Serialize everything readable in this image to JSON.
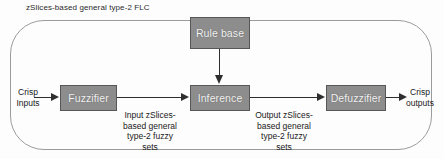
{
  "diagram": {
    "title": "zSlices-based general type-2 FLC",
    "blocks": {
      "rule_base": "Rule base",
      "fuzzifier": "Fuzzifier",
      "inference": "Inference",
      "defuzzifier": "Defuzzifier"
    },
    "labels": {
      "crisp_inputs": "Crisp\nInputs",
      "crisp_outputs": "Crisp\noutputs",
      "input_sets": "Input zSlices-\nbased general\ntype-2 fuzzy\nsets",
      "output_sets": "Output zSlices-\nbased general\ntype-2 fuzzy\nsets"
    },
    "icons": {
      "arrow_input": "arrow-right-icon",
      "arrow_fuzzifier_to_inference": "arrow-right-icon",
      "arrow_rulebase_to_inference": "arrow-down-icon",
      "arrow_inference_to_defuzzifier": "arrow-right-icon",
      "arrow_output": "arrow-right-icon"
    },
    "colors": {
      "block_fill": "#8d8d8d",
      "block_border": "#575757",
      "block_text": "#f2f2f2",
      "container_border": "#9b9b9b",
      "connector": "#2e2e2e",
      "background": "#fdfdfd"
    }
  }
}
